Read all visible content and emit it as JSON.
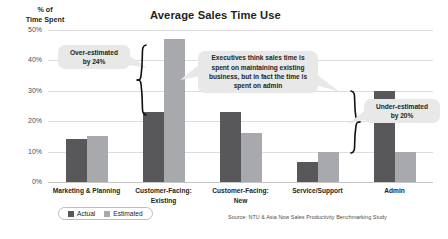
{
  "axis_title": "% of\nTime Spent",
  "title": "Average Sales Time Use",
  "source": "Source: NTU & Asia Now Sales Productivity Benchmarking Study",
  "legend": {
    "actual_label": "Actual",
    "estimated_label": "Estimated"
  },
  "colors": {
    "actual": "#58585b",
    "estimated": "#a7a9ac",
    "callout_bg": "#e8e8e8",
    "gridline": "#dcdcdc",
    "text": "#231f20"
  },
  "callouts": [
    {
      "id": "over-estimated",
      "text": "Over-estimated by 24%",
      "line1": "Over-estimated",
      "line2": "by 24%"
    },
    {
      "id": "executive-insight",
      "text": "Executives think sales time is spent on maintaining existing business, but in fact the time is spent on admin"
    },
    {
      "id": "under-estimated",
      "text": "Under-estimated by 20%",
      "line1": "Under-estimated",
      "line2": "by 20%"
    }
  ],
  "chart_data": {
    "type": "bar",
    "title": "Average Sales Time Use",
    "xlabel": "",
    "ylabel": "% of Time Spent",
    "ylim": [
      0,
      50
    ],
    "ytick_labels": [
      "0%",
      "10%",
      "20%",
      "30%",
      "40%",
      "50%"
    ],
    "ytick_values": [
      0,
      10,
      20,
      30,
      40,
      50
    ],
    "grid": true,
    "legend_position": "bottom-left",
    "categories": [
      "Marketing & Planning",
      "Customer-Facing: Existing",
      "Customer-Facing: New",
      "Service/Support",
      "Admin"
    ],
    "category_lines": [
      [
        "Marketing & Planning"
      ],
      [
        "Customer-Facing:",
        "Existing"
      ],
      [
        "Customer-Facing:",
        "New"
      ],
      [
        "Service/Support"
      ],
      [
        "Admin"
      ]
    ],
    "series": [
      {
        "name": "Actual",
        "values": [
          14,
          23,
          23,
          6.5,
          30
        ]
      },
      {
        "name": "Estimated",
        "values": [
          15,
          47,
          16,
          10,
          10
        ]
      }
    ],
    "annotations": [
      "Over-estimated by 24%",
      "Executives think sales time is spent on maintaining existing business, but in fact the time is spent on admin",
      "Under-estimated by 20%"
    ]
  }
}
